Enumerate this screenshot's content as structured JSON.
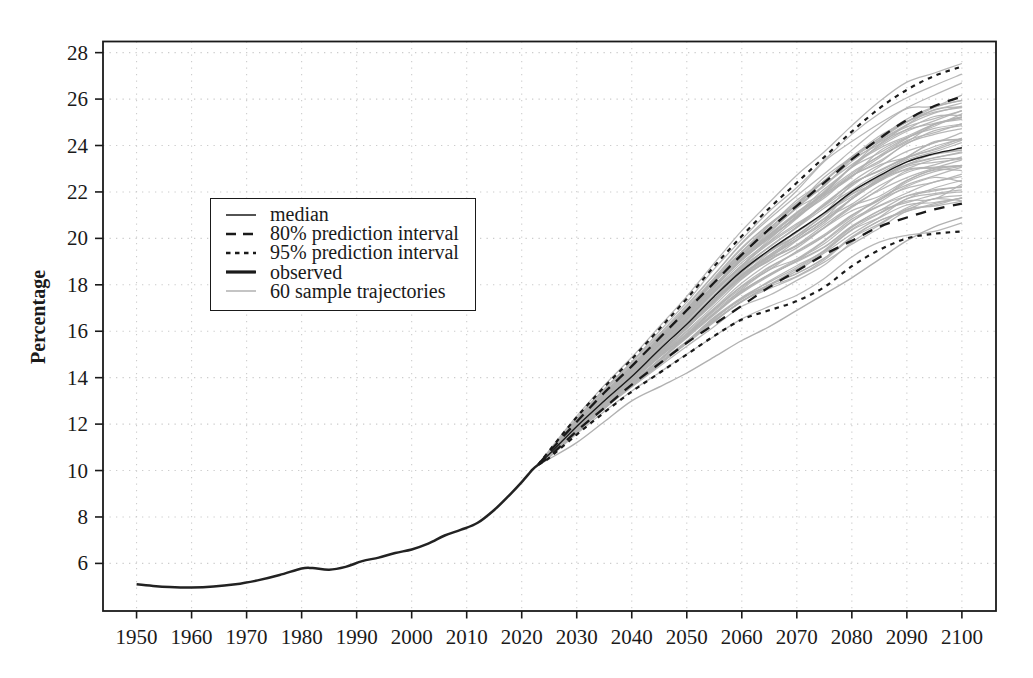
{
  "figure": {
    "background": "#ffffff"
  },
  "chart_data": {
    "type": "line",
    "title": "",
    "xlabel": "",
    "ylabel": "Percentage",
    "xlim": [
      1943.9,
      2106.2
    ],
    "ylim": [
      3.95,
      28.48
    ],
    "x_ticks": [
      1950,
      1960,
      1970,
      1980,
      1990,
      2000,
      2010,
      2020,
      2030,
      2040,
      2050,
      2060,
      2070,
      2080,
      2090,
      2100
    ],
    "y_ticks": [
      6,
      8,
      10,
      12,
      14,
      16,
      18,
      20,
      22,
      24,
      26,
      28
    ],
    "grid": "dotted",
    "colors": {
      "line": "#1a1a1a",
      "trajectory": "#b1b1b1",
      "grid": "#cccccc",
      "background": "#ffffff"
    },
    "legend": {
      "position": "upper-left-inset",
      "entries": [
        {
          "label": "median",
          "style": "solid-thin",
          "color": "#1a1a1a"
        },
        {
          "label": "80% prediction interval",
          "style": "long-dash",
          "color": "#1a1a1a"
        },
        {
          "label": "95% prediction interval",
          "style": "short-dash",
          "color": "#1a1a1a"
        },
        {
          "label": "observed",
          "style": "solid-thick",
          "color": "#1a1a1a"
        },
        {
          "label": "60 sample trajectories",
          "style": "solid-thin",
          "color": "#b1b1b1"
        }
      ]
    },
    "observed": {
      "x": [
        1950,
        1953,
        1956,
        1960,
        1964,
        1968,
        1972,
        1976,
        1980,
        1982,
        1985,
        1988,
        1991,
        1994,
        1997,
        2000,
        2003,
        2006,
        2009,
        2012,
        2015,
        2018,
        2020,
        2022,
        2023
      ],
      "y": [
        5.1,
        5.03,
        4.98,
        4.96,
        5.0,
        5.1,
        5.27,
        5.5,
        5.78,
        5.8,
        5.73,
        5.85,
        6.1,
        6.25,
        6.45,
        6.6,
        6.85,
        7.2,
        7.45,
        7.75,
        8.3,
        9.0,
        9.5,
        10.05,
        10.25
      ]
    },
    "projection": {
      "x": [
        2023,
        2025,
        2030,
        2035,
        2040,
        2045,
        2050,
        2055,
        2060,
        2065,
        2070,
        2075,
        2080,
        2085,
        2090,
        2095,
        2100
      ],
      "median": [
        10.25,
        10.7,
        11.9,
        13.0,
        14.05,
        15.2,
        16.3,
        17.5,
        18.6,
        19.5,
        20.3,
        21.1,
        22.0,
        22.7,
        23.3,
        23.65,
        23.9
      ],
      "pi80_upper": [
        10.25,
        10.8,
        12.1,
        13.35,
        14.5,
        15.7,
        16.9,
        18.1,
        19.3,
        20.4,
        21.4,
        22.4,
        23.4,
        24.3,
        25.1,
        25.7,
        26.1
      ],
      "pi80_lower": [
        10.25,
        10.6,
        11.7,
        12.7,
        13.7,
        14.6,
        15.5,
        16.3,
        17.1,
        17.9,
        18.6,
        19.3,
        19.9,
        20.5,
        20.9,
        21.25,
        21.5
      ],
      "pi95_upper": [
        10.25,
        10.85,
        12.3,
        13.6,
        14.8,
        16.1,
        17.4,
        18.8,
        20.1,
        21.3,
        22.4,
        23.5,
        24.6,
        25.6,
        26.4,
        27.0,
        27.4
      ],
      "pi95_lower": [
        10.25,
        10.55,
        11.55,
        12.5,
        13.4,
        14.2,
        15.0,
        15.8,
        16.5,
        16.9,
        17.3,
        17.9,
        18.8,
        19.5,
        20.0,
        20.2,
        20.3
      ]
    },
    "sample_trajectories": {
      "count": 60,
      "seed": 42,
      "low_outlier": [
        10.25,
        10.5,
        11.2,
        12.1,
        13.0,
        13.6,
        14.2,
        14.9,
        15.6,
        16.2,
        16.9,
        17.6,
        18.3,
        19.1,
        19.9,
        20.5,
        20.9
      ]
    }
  }
}
